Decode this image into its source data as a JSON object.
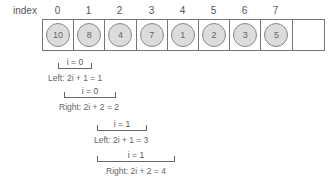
{
  "index_label": "index",
  "indices": [
    "0",
    "1",
    "2",
    "3",
    "4",
    "5",
    "6",
    "7"
  ],
  "cells": [
    "10",
    "8",
    "4",
    "7",
    "1",
    "2",
    "3",
    "5",
    ""
  ],
  "annotations": [
    {
      "bracket_label": "i = 0",
      "formula": "Left: 2i + 1 = 1"
    },
    {
      "bracket_label": "i = 0",
      "formula": "Right: 2i + 2 = 2"
    },
    {
      "bracket_label": "i = 1",
      "formula": "Left: 2i + 1 = 3"
    },
    {
      "bracket_label": "i = 1",
      "formula": "Right: 2i + 2 = 4"
    }
  ],
  "colors": {
    "node_fill": "#dcdcdc",
    "border": "#777777",
    "text": "#666666"
  }
}
